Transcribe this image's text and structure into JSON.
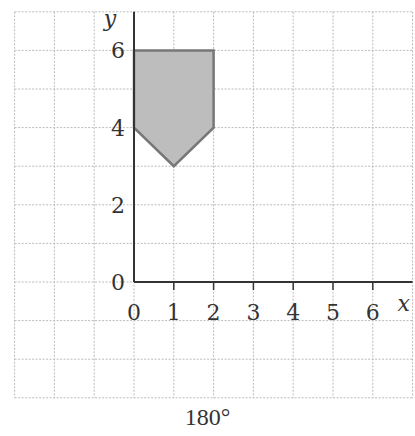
{
  "figure": {
    "caption": "180°",
    "axes": {
      "x_label": "x",
      "y_label": "y",
      "x_ticks": [
        "0",
        "1",
        "2",
        "3",
        "4",
        "5",
        "6"
      ],
      "y_ticks": [
        "0",
        "2",
        "4",
        "6"
      ]
    },
    "grid": {
      "x_range": [
        -3,
        7
      ],
      "y_range": [
        -3,
        7
      ],
      "line_color": "#bbbbbb"
    },
    "shape": {
      "name": "pentagon",
      "vertices": [
        [
          0,
          6
        ],
        [
          2,
          6
        ],
        [
          2,
          4
        ],
        [
          1,
          3
        ],
        [
          0,
          4
        ]
      ],
      "fill": "#bdbdbd",
      "stroke": "#777777"
    }
  }
}
